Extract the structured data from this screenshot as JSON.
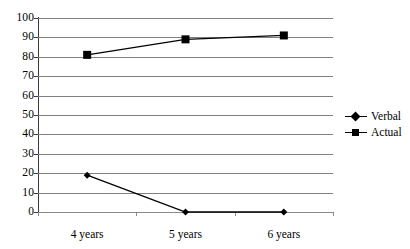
{
  "chart_data": {
    "type": "line",
    "title": "",
    "xlabel": "",
    "ylabel": "",
    "categories": [
      "4 years",
      "5 years",
      "6 years"
    ],
    "series": [
      {
        "name": "Verbal",
        "marker": "diamond",
        "color": "#000000",
        "values": [
          19,
          0,
          0
        ]
      },
      {
        "name": "Actual",
        "marker": "square",
        "color": "#000000",
        "values": [
          81,
          89,
          91
        ]
      }
    ],
    "ylim": [
      0,
      100
    ],
    "ytick_step": 10,
    "yticks": [
      0,
      10,
      20,
      30,
      40,
      50,
      60,
      70,
      80,
      90,
      100
    ],
    "ytick_labels": [
      "0",
      "10",
      "20",
      "30",
      "40",
      "50",
      "60",
      "70",
      "80",
      "90",
      "100"
    ],
    "grid": {
      "horizontal": true,
      "vertical": false,
      "color": "#808080"
    },
    "legend": {
      "position": "right",
      "entries": [
        "Verbal",
        "Actual"
      ]
    },
    "background": "#ffffff"
  }
}
